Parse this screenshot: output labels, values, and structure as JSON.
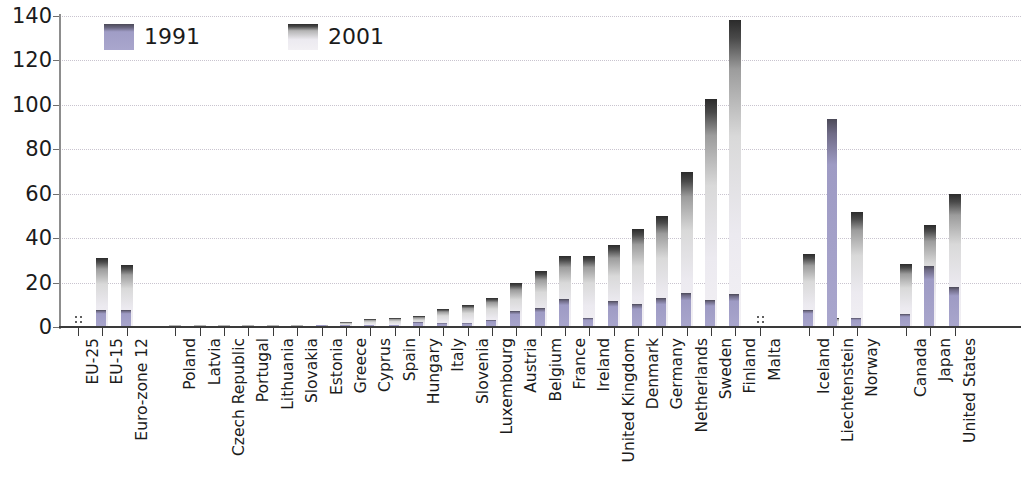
{
  "chart_data": {
    "type": "bar",
    "title": "",
    "xlabel": "",
    "ylabel": "",
    "ylim": [
      0,
      140
    ],
    "ytick_step": 20,
    "yticks": [
      "0",
      "20",
      "40",
      "60",
      "80",
      "100",
      "120",
      "140"
    ],
    "grid": true,
    "legend_position": "top-left",
    "categories": [
      "EU-25",
      "EU-15",
      "Euro-zone 12",
      "Poland",
      "Latvia",
      "Czech Republic",
      "Portugal",
      "Lithuania",
      "Slovakia",
      "Estonia",
      "Greece",
      "Cyprus",
      "Spain",
      "Hungary",
      "Italy",
      "Slovenia",
      "Luxembourg",
      "Austria",
      "Belgium",
      "France",
      "Ireland",
      "United Kingdom",
      "Denmark",
      "Germany",
      "Netherlands",
      "Sweden",
      "Finland",
      "Malta",
      "Iceland",
      "Liechtenstein",
      "Norway",
      "Canada",
      "Japan",
      "United States"
    ],
    "group_gaps_after": [
      "Euro-zone 12",
      "Malta",
      "Norway"
    ],
    "series": [
      {
        "name": "1991",
        "color": "#a9a6cd",
        "values": [
          null,
          7.8,
          7.5,
          0,
          0,
          0,
          0,
          0,
          0,
          0.3,
          0.6,
          0.8,
          1.0,
          2.2,
          2.0,
          2.0,
          3.2,
          7.0,
          8.5,
          12.6,
          4.2,
          11.5,
          10.5,
          13.0,
          15.5,
          12.0,
          15.0,
          null,
          7.8,
          93.5,
          4.0,
          5.8,
          27.5,
          18.0
        ]
      },
      {
        "name": "2001",
        "color": "#eceaf0",
        "values": [
          null,
          31.0,
          28.0,
          0.2,
          0.3,
          0.4,
          0.5,
          0.6,
          0.8,
          1.0,
          2.2,
          3.8,
          4.2,
          5.0,
          8.0,
          10.0,
          13.0,
          20.0,
          25.0,
          32.0,
          32.0,
          37.0,
          44.0,
          50.0,
          70.0,
          102.5,
          138.0,
          null,
          33.0,
          4.0,
          52.0,
          28.5,
          46.0,
          60.0
        ]
      }
    ],
    "no_data_marker": ":",
    "no_data_categories": [
      "EU-25",
      "Malta"
    ]
  },
  "legend": {
    "items": [
      {
        "label": "1991",
        "swatch": "swatch-1991"
      },
      {
        "label": "2001",
        "swatch": "swatch-2001"
      }
    ]
  }
}
